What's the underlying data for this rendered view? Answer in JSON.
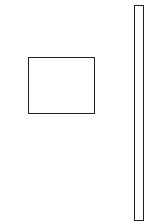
{
  "canvas": {
    "width": 154,
    "height": 224,
    "background": "#ffffff"
  },
  "shapes": [
    {
      "id": "box",
      "type": "rectangle",
      "x": 28,
      "y": 57,
      "width": 67,
      "height": 57,
      "stroke": "#222222",
      "stroke_width": 1
    },
    {
      "id": "bar",
      "type": "rectangle",
      "x": 134,
      "y": 5,
      "width": 10,
      "height": 216,
      "stroke": "#222222",
      "stroke_width": 1
    }
  ]
}
